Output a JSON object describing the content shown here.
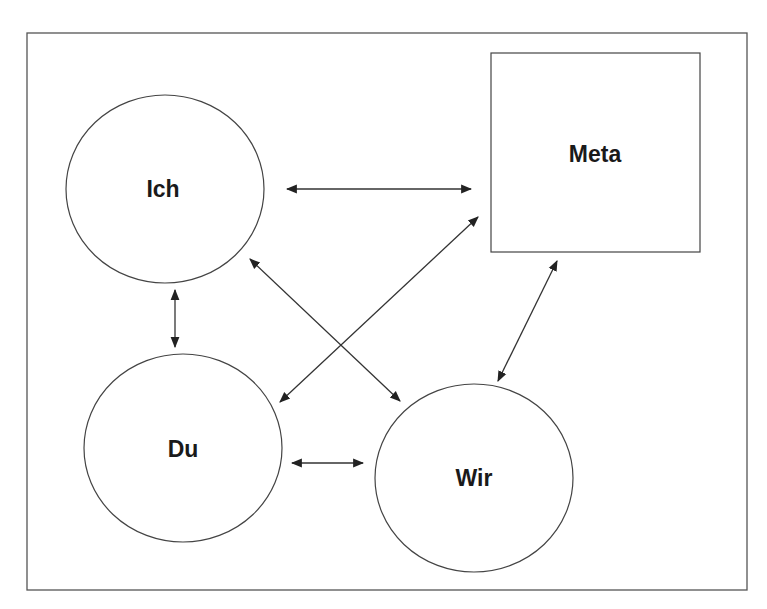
{
  "diagram": {
    "nodes": [
      {
        "id": "ich",
        "label": "Ich",
        "shape": "circle",
        "cx": 165,
        "cy": 189,
        "rx": 99,
        "ry": 94
      },
      {
        "id": "du",
        "label": "Du",
        "shape": "circle",
        "cx": 183,
        "cy": 448,
        "rx": 99,
        "ry": 94
      },
      {
        "id": "wir",
        "label": "Wir",
        "shape": "circle",
        "cx": 474,
        "cy": 478,
        "rx": 99,
        "ry": 94
      },
      {
        "id": "meta",
        "label": "Meta",
        "shape": "square",
        "x": 491,
        "y": 53,
        "w": 209,
        "h": 199
      }
    ],
    "edges": [
      {
        "from": "ich",
        "to": "meta",
        "bidirectional": true
      },
      {
        "from": "ich",
        "to": "du",
        "bidirectional": true
      },
      {
        "from": "ich",
        "to": "wir",
        "bidirectional": true
      },
      {
        "from": "du",
        "to": "meta",
        "bidirectional": true
      },
      {
        "from": "du",
        "to": "wir",
        "bidirectional": true
      },
      {
        "from": "wir",
        "to": "meta",
        "bidirectional": true
      }
    ]
  },
  "labels": {
    "ich": "Ich",
    "du": "Du",
    "wir": "Wir",
    "meta": "Meta"
  },
  "colors": {
    "stroke": "#444444",
    "text": "#1a1a1a",
    "background": "#ffffff"
  }
}
